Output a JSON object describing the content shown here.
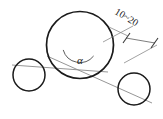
{
  "diagram": {
    "angle_label": "α",
    "dimension_label": "10~20",
    "colors": {
      "outline": "#1a1a1a",
      "center_line": "#8a8a8a",
      "dimension": "#6f6f6f",
      "background": "#ffffff",
      "text": "#1a1a1a"
    },
    "circles": [
      {
        "name": "large-circle",
        "role": "main",
        "cx": 80,
        "cy": 45,
        "r": 33.5
      },
      {
        "name": "left-small-circle",
        "role": "roller",
        "cx": 29,
        "cy": 75,
        "r": 16
      },
      {
        "name": "right-small-circle",
        "role": "roller",
        "cx": 134,
        "cy": 89,
        "r": 16
      }
    ],
    "center_lines": [
      {
        "name": "left-center-line",
        "x1": 12,
        "y1": 65,
        "x2": 108,
        "y2": 72
      },
      {
        "name": "right-center-line",
        "x1": 47,
        "y1": 56,
        "x2": 152,
        "y2": 103
      }
    ],
    "angle": {
      "vertex_x": 80,
      "vertex_y": 45,
      "arc_radius": 14,
      "label_x": 80,
      "label_y": 64
    },
    "dimension": {
      "offset_line": {
        "x1": 108,
        "y1": 27,
        "x2": 157,
        "y2": 52
      },
      "extension_a": {
        "x1": 101,
        "y1": 41,
        "x2": 130,
        "y2": 25
      },
      "extension_b": {
        "x1": 122,
        "y1": 64,
        "x2": 152,
        "y2": 30
      },
      "tick_left_x": 129,
      "tick_left_y": 38,
      "tick_right_x": 152,
      "tick_right_y": 41,
      "text_x": 125,
      "text_y": 20,
      "text_rotation": 31
    }
  }
}
